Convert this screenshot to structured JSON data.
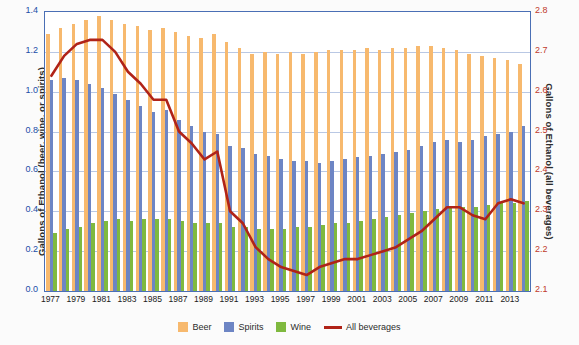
{
  "chart_data": {
    "type": "bar",
    "title": "",
    "subtitle": "",
    "xlabel": "",
    "ylabel": "Gallons of Ethanol (beer, wine, or spirits)",
    "y2label": "Gallons of Ethanol (all beverages)",
    "ylim": [
      0.0,
      1.4
    ],
    "y2lim": [
      2.1,
      2.8
    ],
    "yticks": [
      "0.0",
      "0.2",
      "0.4",
      "0.6",
      "0.8",
      "1.0",
      "1.2",
      "1.4"
    ],
    "y2ticks": [
      "2.1",
      "2.2",
      "2.3",
      "2.4",
      "2.5",
      "2.6",
      "2.7",
      "2.8"
    ],
    "grid": true,
    "legend_position": "bottom",
    "categories": [
      1977,
      1978,
      1979,
      1980,
      1981,
      1982,
      1983,
      1984,
      1985,
      1986,
      1987,
      1988,
      1989,
      1990,
      1991,
      1992,
      1993,
      1994,
      1995,
      1996,
      1997,
      1998,
      1999,
      2000,
      2001,
      2002,
      2003,
      2004,
      2005,
      2006,
      2007,
      2008,
      2009,
      2010,
      2011,
      2012,
      2013,
      2014
    ],
    "xtick_labels": [
      "1977",
      "1979",
      "1981",
      "1983",
      "1985",
      "1987",
      "1989",
      "1991",
      "1993",
      "1995",
      "1997",
      "1999",
      "2001",
      "2003",
      "2005",
      "2007",
      "2009",
      "2011",
      "2013"
    ],
    "series": [
      {
        "name": "Beer",
        "color": "#f7b96e",
        "axis": "left",
        "values": [
          1.29,
          1.32,
          1.34,
          1.36,
          1.38,
          1.36,
          1.34,
          1.33,
          1.31,
          1.32,
          1.3,
          1.28,
          1.27,
          1.29,
          1.25,
          1.22,
          1.19,
          1.2,
          1.19,
          1.2,
          1.19,
          1.2,
          1.21,
          1.21,
          1.21,
          1.22,
          1.21,
          1.22,
          1.22,
          1.23,
          1.23,
          1.22,
          1.21,
          1.19,
          1.18,
          1.17,
          1.16,
          1.14
        ]
      },
      {
        "name": "Spirits",
        "color": "#6d85c4",
        "axis": "left",
        "values": [
          1.06,
          1.07,
          1.06,
          1.04,
          1.02,
          0.99,
          0.96,
          0.93,
          0.9,
          0.91,
          0.86,
          0.83,
          0.8,
          0.79,
          0.73,
          0.72,
          0.69,
          0.68,
          0.66,
          0.65,
          0.65,
          0.64,
          0.65,
          0.66,
          0.67,
          0.68,
          0.69,
          0.7,
          0.71,
          0.73,
          0.75,
          0.76,
          0.75,
          0.76,
          0.78,
          0.79,
          0.8,
          0.83
        ]
      },
      {
        "name": "Wine",
        "color": "#7fb93f",
        "axis": "left",
        "values": [
          0.29,
          0.31,
          0.32,
          0.34,
          0.35,
          0.36,
          0.35,
          0.36,
          0.36,
          0.36,
          0.35,
          0.34,
          0.34,
          0.34,
          0.32,
          0.32,
          0.31,
          0.31,
          0.31,
          0.32,
          0.32,
          0.33,
          0.34,
          0.34,
          0.35,
          0.36,
          0.37,
          0.38,
          0.39,
          0.4,
          0.41,
          0.42,
          0.42,
          0.42,
          0.43,
          0.44,
          0.44,
          0.45
        ]
      },
      {
        "name": "All beverages",
        "color": "#b02318",
        "axis": "right",
        "type": "line",
        "values": [
          2.64,
          2.69,
          2.72,
          2.73,
          2.73,
          2.7,
          2.65,
          2.62,
          2.58,
          2.58,
          2.5,
          2.47,
          2.43,
          2.45,
          2.3,
          2.27,
          2.21,
          2.18,
          2.16,
          2.15,
          2.14,
          2.16,
          2.17,
          2.18,
          2.18,
          2.19,
          2.2,
          2.21,
          2.23,
          2.25,
          2.28,
          2.31,
          2.31,
          2.29,
          2.28,
          2.32,
          2.33,
          2.32
        ]
      }
    ],
    "legend": [
      {
        "label": "Beer",
        "color": "#f7b96e",
        "marker": "swatch"
      },
      {
        "label": "Spirits",
        "color": "#6d85c4",
        "marker": "swatch"
      },
      {
        "label": "Wine",
        "color": "#7fb93f",
        "marker": "swatch"
      },
      {
        "label": "All beverages",
        "color": "#b02318",
        "marker": "line"
      }
    ]
  }
}
